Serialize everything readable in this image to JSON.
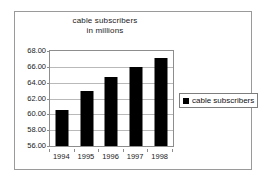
{
  "chart_data": {
    "type": "bar",
    "title": "cable subscribers in millions",
    "title_lines": [
      "cable subscribers",
      "in millions"
    ],
    "categories": [
      "1994",
      "1995",
      "1996",
      "1997",
      "1998"
    ],
    "values": [
      60.5,
      63.0,
      64.7,
      66.0,
      67.1
    ],
    "series": [
      {
        "name": "cable subscribers",
        "values": [
          60.5,
          63.0,
          64.7,
          66.0,
          67.1
        ],
        "color": "#000000"
      }
    ],
    "xlabel": "",
    "ylabel": "",
    "ylim": [
      56.0,
      68.0
    ],
    "ytick_values": [
      56.0,
      58.0,
      60.0,
      62.0,
      64.0,
      66.0,
      68.0
    ],
    "ytick_labels": [
      "56.00",
      "58.00",
      "60.00",
      "62.00",
      "64.00",
      "66.00",
      "68.00"
    ],
    "grid": true,
    "grid_axis": "y",
    "legend_position": "right",
    "legend_entries": [
      {
        "label": "cable subscribers",
        "color": "#000000",
        "marker": "square"
      }
    ]
  },
  "colors": {
    "background": "#ffffff",
    "outer_border": "#9a9a9a",
    "plot_border": "#8d8d8d",
    "gridline": "#b9b9b9",
    "bar": "#000000",
    "text": "#1a1a1a",
    "legend_border": "#7d7d7d"
  },
  "icons": {
    "legend_swatch": "black-square-icon"
  }
}
